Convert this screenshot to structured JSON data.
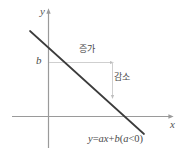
{
  "figure": {
    "kind": "math-diagram",
    "width": 183,
    "height": 158,
    "background": "#ffffff"
  },
  "axes": {
    "x_label": "x",
    "y_label": "y",
    "origin": {
      "x": 48,
      "y": 116
    },
    "x_axis": {
      "x1": 12,
      "y1": 116,
      "x2": 172,
      "y2": 116,
      "color": "#9a9a9a",
      "arrow": "right"
    },
    "y_axis": {
      "x1": 48,
      "y1": 148,
      "x2": 48,
      "y2": 10,
      "color": "#9a9a9a",
      "arrow": "up"
    }
  },
  "line": {
    "label_intercept": "b",
    "color": "#3c3c3c",
    "x1": 30,
    "y1": 31,
    "x2": 144,
    "y2": 134,
    "y_intercept_point": {
      "x": 48,
      "y": 47
    },
    "x_intercept_point": {
      "x": 128,
      "y": 117
    }
  },
  "annotations": {
    "increase_label": "증가",
    "decrease_label": "감소",
    "guide_color": "#cfcfcf",
    "horizontal_guide": {
      "x1": 48,
      "y1": 62,
      "x2": 113,
      "y2": 62
    },
    "vertical_guide": {
      "x1": 113,
      "y1": 62,
      "x2": 113,
      "y2": 98
    }
  },
  "equation": {
    "full": "y=ax+b(a<0)",
    "lhs": "y",
    "equals": "=",
    "term_ax": "ax",
    "plus": "+",
    "term_b": "b",
    "condition_open": "(",
    "condition_var": "a",
    "condition_rel": "<",
    "condition_val": "0",
    "condition_close": ")"
  },
  "colors": {
    "axis": "#9a9a9a",
    "graph_line": "#3c3c3c",
    "guide": "#cfcfcf",
    "text": "#4a4a4a",
    "background": "#ffffff"
  }
}
